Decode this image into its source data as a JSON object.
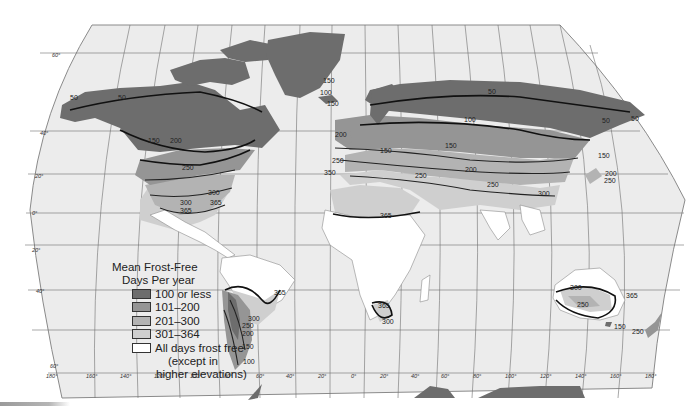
{
  "map": {
    "title": "Mean Frost-Free Days Per year",
    "projection": "Robinson-style world map",
    "colors": {
      "days_100_or_less": "#6d6d6d",
      "days_101_200": "#959595",
      "days_201_300": "#b3b3b3",
      "days_301_364": "#cfcfcf",
      "all_days_frost_free": "#ffffff",
      "ocean": "#ececec"
    }
  },
  "legend": {
    "title_line1": "Mean Frost-Free",
    "title_line2": "Days Per year",
    "items": [
      {
        "label": "100 or less",
        "color": "#6d6d6d"
      },
      {
        "label": "101–200",
        "color": "#959595"
      },
      {
        "label": "201–300",
        "color": "#b3b3b3"
      },
      {
        "label": "301–364",
        "color": "#cfcfcf"
      },
      {
        "label": "All days frost free",
        "color": "#ffffff"
      }
    ],
    "note_line1": "(except in",
    "note_line2": "higher elevations)"
  },
  "axes": {
    "latitude_labels": [
      "60°",
      "40°",
      "20°",
      "0°",
      "20°",
      "40°",
      "60°"
    ],
    "longitude_labels": [
      "180°",
      "160°",
      "140°",
      "120°",
      "100°",
      "80°",
      "60°",
      "40°",
      "20°",
      "0°",
      "20°",
      "40°",
      "60°",
      "80°",
      "100°",
      "120°",
      "140°",
      "160°",
      "180°"
    ]
  },
  "isoline_labels": {
    "north_america": [
      "50",
      "50",
      "150",
      "200",
      "250",
      "300",
      "300",
      "365",
      "365"
    ],
    "greenland_iceland": [
      "50",
      "150"
    ],
    "europe": [
      "150",
      "100",
      "200",
      "150",
      "250",
      "350",
      "250"
    ],
    "asia": [
      "50",
      "100",
      "150",
      "200",
      "250",
      "300",
      "50",
      "50",
      "150",
      "200",
      "250"
    ],
    "africa": [
      "365",
      "365",
      "300"
    ],
    "south_america": [
      "365",
      "300",
      "250",
      "200",
      "150",
      "100"
    ],
    "australia_nz": [
      "300",
      "250",
      "365",
      "150",
      "250"
    ]
  }
}
